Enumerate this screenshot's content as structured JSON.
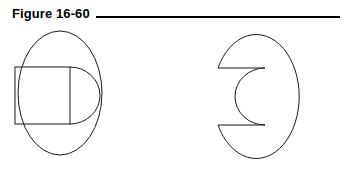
{
  "figure": {
    "caption": "Figure 16-60",
    "rule": {
      "present": true,
      "color": "#000000"
    },
    "background_color": "#ffffff",
    "line_color": "#1a1a1a",
    "line_width": 1
  },
  "drawing": {
    "title": "Two orthographic views of a cylindrical part with a slot",
    "views": [
      {
        "name": "left-view",
        "label": "front view with hidden slot outline",
        "shapes": [
          {
            "name": "outer-circle",
            "type": "ellipse",
            "cx": 60,
            "cy": 67,
            "rx": 42,
            "ry": 62
          },
          {
            "name": "slot-rectangle",
            "type": "rect",
            "x": 15,
            "y": 41,
            "width": 55,
            "height": 57
          },
          {
            "name": "slot-arc",
            "type": "path",
            "d": "M 70 41 A 30 28.5 0 0 1 70 98"
          }
        ]
      },
      {
        "name": "right-view",
        "label": "front view with slot cut out",
        "shapes": [
          {
            "name": "notched-circle",
            "type": "path",
            "d": "M 218 42 L 265 42 A 30 28.5 0 0 0 265 99 L 218 99 A 43 62 0 1 0 218 42 Z"
          }
        ]
      }
    ]
  }
}
